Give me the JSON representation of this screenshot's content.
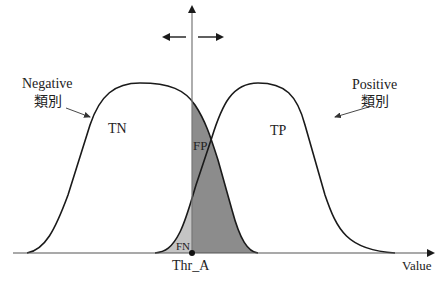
{
  "diagram": {
    "type": "threshold-distribution",
    "labels": {
      "negative_en": "Negative",
      "negative_zh": "類別",
      "positive_en": "Positive",
      "positive_zh": "類別",
      "tn": "TN",
      "tp": "TP",
      "fp": "FP",
      "fn": "FN",
      "threshold": "Thr_A",
      "x_axis": "Value"
    },
    "colors": {
      "curve": "#1a1a1a",
      "axis": "#555555",
      "fp_fill": "#8c8c8c",
      "fn_fill": "#c4c4c4",
      "background": "#ffffff"
    }
  }
}
